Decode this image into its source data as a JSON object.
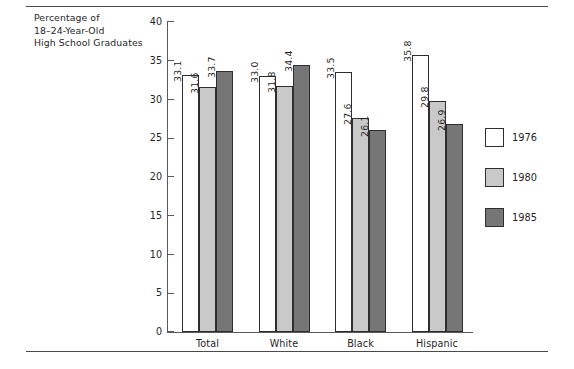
{
  "figure": {
    "background": "#ffffff",
    "top_rule": true,
    "bottom_rule": true
  },
  "chart_data": {
    "type": "bar",
    "title": "",
    "axis_caption_lines": [
      "Percentage of",
      "18–24-Year-Old",
      "High School Graduates"
    ],
    "xlabel": "",
    "ylabel": "Percentage of 18–24-Year-Old High School Graduates",
    "categories": [
      "Total",
      "White",
      "Black",
      "Hispanic"
    ],
    "series": [
      {
        "name": "1976",
        "color": "#ffffff",
        "values": [
          33.1,
          33.0,
          33.5,
          35.8
        ]
      },
      {
        "name": "1980",
        "color": "#c9c9c9",
        "values": [
          31.6,
          31.8,
          27.6,
          29.8
        ]
      },
      {
        "name": "1985",
        "color": "#767676",
        "values": [
          33.7,
          34.4,
          26.1,
          26.9
        ]
      }
    ],
    "ylim": [
      0,
      40
    ],
    "yticks": [
      0,
      5,
      10,
      15,
      20,
      25,
      30,
      35,
      40
    ],
    "ytick_labels": [
      "0",
      "5",
      "10",
      "15",
      "20",
      "25",
      "30",
      "35",
      "40"
    ],
    "grid": false,
    "data_labels": true,
    "data_label_rotation": 90,
    "legend_position": "right",
    "legend_entries": [
      "1976",
      "1980",
      "1985"
    ]
  }
}
